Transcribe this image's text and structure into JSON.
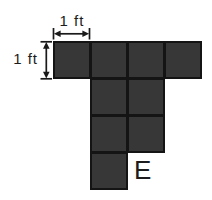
{
  "labels": {
    "width_dimension": "1 ft",
    "height_dimension": "1 ft",
    "figure_letter": "E"
  },
  "icons": {
    "width_arrow": "double-arrow-horizontal",
    "height_arrow": "double-arrow-vertical"
  },
  "grid": {
    "square_px": 37,
    "origin_x": 53,
    "origin_y": 41,
    "rows": 4,
    "cols": 4,
    "cells": [
      [
        0,
        0
      ],
      [
        0,
        1
      ],
      [
        0,
        2
      ],
      [
        0,
        3
      ],
      [
        1,
        1
      ],
      [
        1,
        2
      ],
      [
        2,
        1
      ],
      [
        2,
        2
      ],
      [
        3,
        1
      ]
    ]
  },
  "colors": {
    "square_fill": "#373737",
    "square_border": "#141414",
    "background": "#ffffff",
    "text": "#1c1c1c"
  }
}
